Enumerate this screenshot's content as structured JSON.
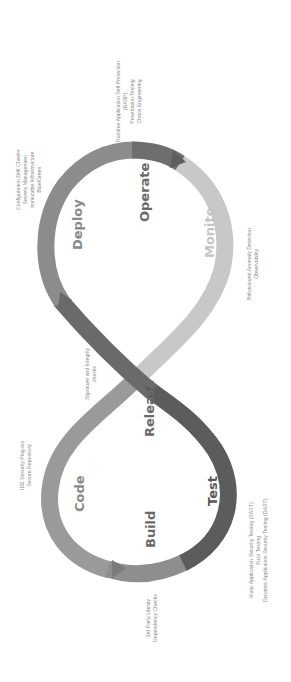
{
  "diagram": {
    "orientation": "rotated-90-ccw",
    "colors": {
      "code": "#9a9a9a",
      "build": "#8e8e8e",
      "test": "#5c5c5c",
      "release": "#6a6a6a",
      "deploy": "#8c8c8c",
      "operate": "#6e6e6e",
      "monitor": "#c8c8c8",
      "stage_label": "#6a6a6a",
      "stage_label_light": "#c4c4c4",
      "note_text": "#8a8a8a"
    },
    "stages": {
      "code": "Code",
      "build": "Build",
      "test": "Test",
      "release": "Release",
      "deploy": "Deploy",
      "operate": "Operate",
      "monitor": "Monitor"
    },
    "annotations": {
      "code": [
        "IDE Security Plug-ins",
        "Secure Repository"
      ],
      "build": [
        "3rd Party Library",
        "Dependency Checks"
      ],
      "test": [
        "Static Application Security Testing (SAST)",
        "Fuzz Testing",
        "Dynamic Application Security Testing (DAST)"
      ],
      "release": [
        "Signature and Integrity",
        "checks"
      ],
      "deploy": [
        "Configuration Drift Checks",
        "Secrets Management",
        "Immutable Infrastructure",
        "Blue/Green"
      ],
      "operate": [
        "Runtime Application Self Protection",
        "(RASP)",
        "Penetration Testing",
        "Chaos Engineering"
      ],
      "monitor": [
        "Behavioural Anomaly Detection",
        "Observability"
      ]
    }
  }
}
